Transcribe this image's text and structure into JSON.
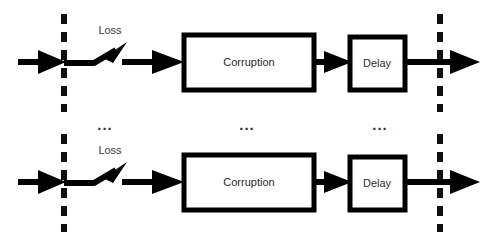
{
  "diagram": {
    "type": "block-diagram",
    "background_color": "#ffffff",
    "line_color": "#000000",
    "text_color": "#2a2a2a",
    "boundaries": [
      {
        "name": "input-boundary",
        "style": "dashed",
        "orientation": "vertical"
      },
      {
        "name": "output-boundary",
        "style": "dashed",
        "orientation": "vertical"
      }
    ],
    "rows": [
      {
        "id": "top-row",
        "loss_label": "Loss",
        "corruption_label": "Corruption",
        "delay_label": "Delay"
      },
      {
        "id": "bottom-row",
        "loss_label": "Loss",
        "corruption_label": "Corruption",
        "delay_label": "Delay"
      }
    ],
    "ellipses": [
      {
        "id": "ellipsis-left",
        "text": "..."
      },
      {
        "id": "ellipsis-center",
        "text": "..."
      },
      {
        "id": "ellipsis-right",
        "text": "..."
      }
    ]
  }
}
